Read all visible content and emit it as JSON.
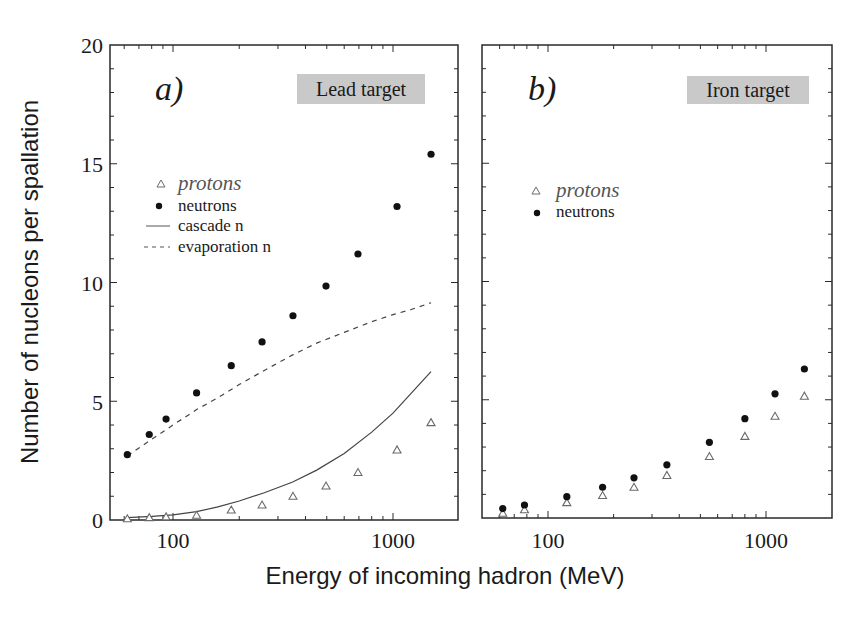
{
  "chart_data": [
    {
      "type": "scatter",
      "panel": "a)",
      "title": "Lead target",
      "xlabel": "Energy of incoming hadron (MeV)",
      "ylabel": "Number of nucleons per spallation",
      "xscale": "log",
      "xlim": [
        48,
        1950
      ],
      "ylim": [
        0,
        20
      ],
      "xticks": [
        100,
        1000
      ],
      "yticks": [
        0,
        5,
        10,
        15,
        20
      ],
      "grid": false,
      "legend": {
        "position": "upper-left",
        "entries": [
          {
            "label": "protons",
            "marker": "open-triangle"
          },
          {
            "label": "neutrons",
            "marker": "filled-circle"
          },
          {
            "label": "cascade n",
            "line": "solid"
          },
          {
            "label": "evaporation n",
            "line": "dashed"
          }
        ]
      },
      "series": [
        {
          "name": "protons",
          "marker": "open-triangle",
          "x": [
            62,
            78,
            93,
            128,
            184,
            254,
            351,
            496,
            693,
            1043,
            1489
          ],
          "y": [
            0.05,
            0.1,
            0.13,
            0.2,
            0.42,
            0.63,
            1.0,
            1.43,
            2.0,
            2.95,
            4.1
          ]
        },
        {
          "name": "neutrons",
          "marker": "filled-circle",
          "x": [
            62,
            78,
            93,
            128,
            184,
            254,
            351,
            496,
            693,
            1043,
            1489
          ],
          "y": [
            2.75,
            3.6,
            4.25,
            5.35,
            6.5,
            7.5,
            8.6,
            9.85,
            11.2,
            13.2,
            15.4
          ]
        },
        {
          "name": "cascade n",
          "line": "solid",
          "x": [
            62,
            80,
            100,
            128,
            160,
            200,
            260,
            350,
            450,
            600,
            800,
            1000,
            1200,
            1489
          ],
          "y": [
            0.1,
            0.15,
            0.22,
            0.35,
            0.55,
            0.8,
            1.15,
            1.6,
            2.1,
            2.8,
            3.7,
            4.5,
            5.3,
            6.25
          ]
        },
        {
          "name": "evaporation n",
          "line": "dashed",
          "x": [
            62,
            80,
            100,
            128,
            160,
            200,
            260,
            350,
            450,
            600,
            800,
            1000,
            1200,
            1489
          ],
          "y": [
            2.7,
            3.4,
            4.0,
            4.65,
            5.15,
            5.7,
            6.3,
            6.95,
            7.45,
            7.9,
            8.35,
            8.65,
            8.85,
            9.15
          ]
        }
      ]
    },
    {
      "type": "scatter",
      "panel": "b)",
      "title": "Iron target",
      "xlabel": "Energy of incoming hadron (MeV)",
      "xscale": "log",
      "xlim": [
        48,
        1950
      ],
      "ylim": [
        0,
        20
      ],
      "xticks": [
        100,
        1000
      ],
      "grid": false,
      "legend": {
        "position": "upper-left",
        "entries": [
          {
            "label": "protons",
            "marker": "open-triangle"
          },
          {
            "label": "neutrons",
            "marker": "filled-circle"
          }
        ]
      },
      "series": [
        {
          "name": "protons",
          "marker": "open-triangle",
          "x": [
            62,
            78,
            122,
            178,
            248,
            351,
            550,
            800,
            1100,
            1500
          ],
          "y": [
            0.2,
            0.35,
            0.65,
            0.95,
            1.3,
            1.8,
            2.6,
            3.45,
            4.3,
            5.15
          ]
        },
        {
          "name": "neutrons",
          "marker": "filled-circle",
          "x": [
            62,
            78,
            122,
            178,
            248,
            351,
            550,
            800,
            1100,
            1500
          ],
          "y": [
            0.4,
            0.55,
            0.9,
            1.3,
            1.7,
            2.25,
            3.2,
            4.2,
            5.25,
            6.3
          ]
        }
      ]
    }
  ],
  "labels": {
    "ylabel": "Number of nucleons per spallation",
    "xlabel": "Energy of incoming hadron (MeV)",
    "panel_a": "a)",
    "panel_b": "b)",
    "target_a": "Lead target",
    "target_b": "Iron target",
    "legend_protons": "protons",
    "legend_neutrons": "neutrons",
    "legend_cascade": "cascade n",
    "legend_evaporation": "evaporation n",
    "yticks": [
      "0",
      "5",
      "10",
      "15",
      "20"
    ],
    "xticks": [
      "100",
      "1000"
    ]
  },
  "colors": {
    "axis": "#2a2a2a",
    "marker": "#111111",
    "triangle": "#6a6a6a",
    "target_bg": "#c9c9c9",
    "curve": "#444444"
  }
}
